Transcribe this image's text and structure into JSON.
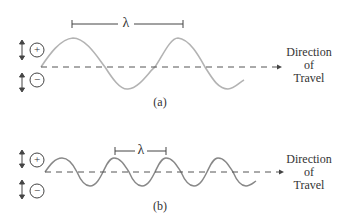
{
  "panels": [
    {
      "id": "a",
      "caption": "(a)",
      "wavelength_label": "λ",
      "positive_label": "+",
      "negative_label": "−",
      "direction_label": [
        "Direction",
        "of",
        "Travel"
      ]
    },
    {
      "id": "b",
      "caption": "(b)",
      "wavelength_label": "λ",
      "positive_label": "+",
      "negative_label": "−",
      "direction_label": [
        "Direction",
        "of",
        "Travel"
      ]
    }
  ],
  "colors": {
    "wave": "#b3b3b3",
    "axis": "#555555",
    "text": "#333333"
  }
}
